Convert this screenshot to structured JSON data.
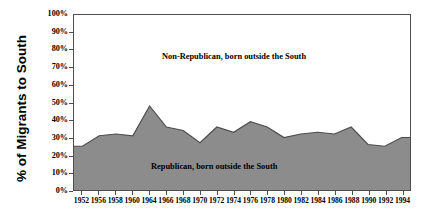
{
  "chart_data": {
    "type": "area",
    "title": "",
    "xlabel": "",
    "ylabel": "% of Migrants to South",
    "ylim": [
      0,
      100
    ],
    "grid": false,
    "legend_position": "inside-plot-annotations",
    "y_tick_labels": [
      "100%",
      "90%",
      "80%",
      "70%",
      "60%",
      "50%",
      "40%",
      "30%",
      "20%",
      "10%",
      "0%"
    ],
    "y_ticks": [
      100,
      90,
      80,
      70,
      60,
      50,
      40,
      30,
      20,
      10,
      0
    ],
    "categories": [
      "1952",
      "1956",
      "1958",
      "1960",
      "1964",
      "1966",
      "1968",
      "1970",
      "1972",
      "1974",
      "1976",
      "1978",
      "1980",
      "1982",
      "1984",
      "1986",
      "1988",
      "1990",
      "1992",
      "1994"
    ],
    "series": [
      {
        "name": "Republican, born outside the South",
        "fill": "#8c8c8c",
        "values": [
          25,
          31,
          32,
          31,
          48,
          36,
          34,
          27,
          36,
          33,
          39,
          36,
          30,
          32,
          33,
          32,
          36,
          26,
          25,
          30
        ]
      },
      {
        "name": "Non-Republican, born outside the South",
        "fill": "#ffffff",
        "values": [
          75,
          69,
          68,
          69,
          52,
          64,
          66,
          73,
          64,
          67,
          61,
          64,
          70,
          68,
          67,
          68,
          64,
          74,
          75,
          70
        ]
      }
    ],
    "annotations": [
      {
        "text": "Non-Republican, born outside the South",
        "x": 1966,
        "y": 73
      },
      {
        "text": "Republican, born outside the South",
        "x": 1968,
        "y": 17
      }
    ]
  },
  "axis": {
    "y_title": "% of Migrants to South"
  },
  "colors": {
    "area_fill": "#8c8c8c",
    "area_line": "#4d4d4d",
    "frame": "#4d4d4d",
    "background": "#ffffff",
    "text": "#000000"
  }
}
